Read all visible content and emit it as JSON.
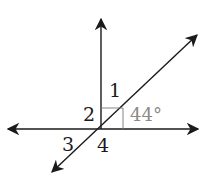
{
  "diagram": {
    "type": "intersecting-lines-angle-figure",
    "labels": {
      "angle1": "1",
      "angle2": "2",
      "angle3": "3",
      "angle4": "4",
      "given_angle": "44°"
    },
    "elements": [
      {
        "name": "horizontal-line",
        "description": "double-headed arrow, horizontal"
      },
      {
        "name": "vertical-ray",
        "description": "ray pointing up from intersection"
      },
      {
        "name": "diagonal-line",
        "description": "double-headed arrow from lower-left to upper-right"
      },
      {
        "name": "right-angle-marker",
        "description": "square marker between vertical ray and horizontal line"
      }
    ],
    "colors": {
      "line": "#1a1a1a",
      "given_angle_text": "#8a8a8a"
    }
  }
}
